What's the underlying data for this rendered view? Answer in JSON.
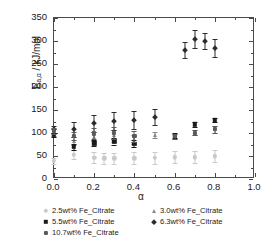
{
  "chart_data": {
    "type": "scatter",
    "title": "",
    "xlabel": "α",
    "ylabel": "E",
    "ylabel_sub": "a,α",
    "ylabel_unit": " / kJ/mol",
    "ylabel_full": "E a,α / kJ/mol",
    "xlim": [
      0.0,
      1.0
    ],
    "ylim": [
      0,
      350
    ],
    "xticks": [
      "0.0",
      "0.2",
      "0.4",
      "0.6",
      "0.8",
      "1.0"
    ],
    "xtick_values": [
      0.0,
      0.2,
      0.4,
      0.6,
      0.8,
      1.0
    ],
    "yticks": [
      "0",
      "50",
      "100",
      "150",
      "200",
      "250",
      "300",
      "350"
    ],
    "ytick_values": [
      0,
      50,
      100,
      150,
      200,
      250,
      300,
      350
    ],
    "grid": false,
    "legend_position": "below-axes",
    "error_bars": "symmetric-vertical",
    "series": [
      {
        "name": "2.5wt% Fe_Citrate",
        "marker": "circle",
        "color": "#c9c9c9",
        "points": [
          {
            "x": 0.0,
            "y": 39,
            "err": 6
          },
          {
            "x": 0.1,
            "y": 53,
            "err": 10
          },
          {
            "x": 0.2,
            "y": 46,
            "err": 12
          },
          {
            "x": 0.25,
            "y": 45,
            "err": 12
          },
          {
            "x": 0.3,
            "y": 45,
            "err": 12
          },
          {
            "x": 0.4,
            "y": 45,
            "err": 13
          },
          {
            "x": 0.5,
            "y": 46,
            "err": 13
          },
          {
            "x": 0.6,
            "y": 47,
            "err": 13
          },
          {
            "x": 0.7,
            "y": 47,
            "err": 13
          },
          {
            "x": 0.8,
            "y": 49,
            "err": 13
          }
        ]
      },
      {
        "name": "3.0wt% Fe_Citrate",
        "marker": "triangle",
        "color": "#8a8a8a",
        "points": [
          {
            "x": 0.0,
            "y": 101,
            "err": 7
          },
          {
            "x": 0.1,
            "y": 83,
            "err": 9
          },
          {
            "x": 0.2,
            "y": 92,
            "err": 10
          },
          {
            "x": 0.3,
            "y": 96,
            "err": 10
          },
          {
            "x": 0.4,
            "y": 86,
            "err": 10
          },
          {
            "x": 0.5,
            "y": 96,
            "err": 6
          },
          {
            "x": 0.6,
            "y": 93,
            "err": 5
          },
          {
            "x": 0.7,
            "y": 101,
            "err": 6
          },
          {
            "x": 0.8,
            "y": 108,
            "err": 7
          }
        ]
      },
      {
        "name": "5.5wt% Fe_Citrate",
        "marker": "square",
        "color": "#1a1a1a",
        "points": [
          {
            "x": 0.0,
            "y": 96,
            "err": 5
          },
          {
            "x": 0.1,
            "y": 70,
            "err": 6
          },
          {
            "x": 0.2,
            "y": 78,
            "err": 7
          },
          {
            "x": 0.3,
            "y": 82,
            "err": 7
          },
          {
            "x": 0.4,
            "y": 77,
            "err": 7
          },
          {
            "x": 0.6,
            "y": 94,
            "err": 5
          },
          {
            "x": 0.7,
            "y": 119,
            "err": 5
          },
          {
            "x": 0.8,
            "y": 128,
            "err": 5
          }
        ]
      },
      {
        "name": "6.3wt% Fe_Citrate",
        "marker": "diamond",
        "color": "#2b2b2b",
        "points": [
          {
            "x": 0.0,
            "y": 108,
            "err": 8
          },
          {
            "x": 0.1,
            "y": 108,
            "err": 17
          },
          {
            "x": 0.2,
            "y": 121,
            "err": 19
          },
          {
            "x": 0.3,
            "y": 126,
            "err": 19
          },
          {
            "x": 0.4,
            "y": 128,
            "err": 20
          },
          {
            "x": 0.5,
            "y": 135,
            "err": 17
          },
          {
            "x": 0.65,
            "y": 280,
            "err": 17
          },
          {
            "x": 0.7,
            "y": 304,
            "err": 19
          },
          {
            "x": 0.75,
            "y": 300,
            "err": 17
          },
          {
            "x": 0.8,
            "y": 285,
            "err": 20
          }
        ]
      },
      {
        "name": "10.7wt% Fe_Citrate",
        "marker": "star",
        "color": "#5a5a5a",
        "points": [
          {
            "x": 0.0,
            "y": 104,
            "err": 6
          },
          {
            "x": 0.1,
            "y": 93,
            "err": 9
          },
          {
            "x": 0.2,
            "y": 99,
            "err": 11
          },
          {
            "x": 0.3,
            "y": 100,
            "err": 12
          },
          {
            "x": 0.4,
            "y": 93,
            "err": 12
          },
          {
            "x": 0.6,
            "y": 93,
            "err": 5
          },
          {
            "x": 0.7,
            "y": 101,
            "err": 6
          },
          {
            "x": 0.8,
            "y": 108,
            "err": 7
          }
        ]
      }
    ]
  },
  "legend": {
    "rows": [
      [
        {
          "label": "2.5wt% Fe_Citrate",
          "marker": "circle",
          "color": "#c9c9c9"
        },
        {
          "label": "3.0wt% Fe_Citrate",
          "marker": "triangle",
          "color": "#8a8a8a"
        }
      ],
      [
        {
          "label": "5.5wt% Fe_Citrate",
          "marker": "square",
          "color": "#1a1a1a"
        },
        {
          "label": "6.3wt% Fe_Citrate",
          "marker": "diamond",
          "color": "#2b2b2b"
        }
      ],
      [
        {
          "label": "10.7wt% Fe_Citrate",
          "marker": "star",
          "color": "#5a5a5a"
        }
      ]
    ]
  },
  "colors": {
    "axis": "#4a4a4a",
    "text": "#1a1a1a",
    "background": "#ffffff"
  }
}
